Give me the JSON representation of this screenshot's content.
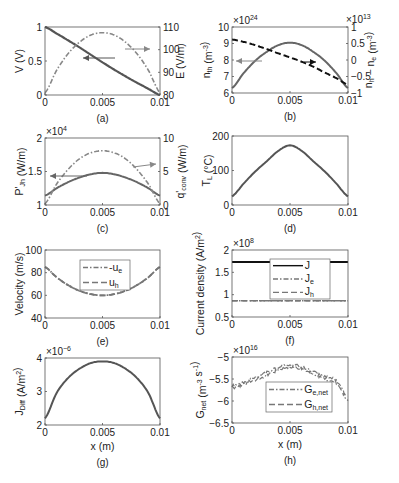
{
  "chart_data": [
    {
      "panel": "a",
      "caption": "(a)",
      "type": "line",
      "x": [
        0,
        0.001,
        0.002,
        0.003,
        0.004,
        0.005,
        0.006,
        0.007,
        0.008,
        0.009,
        0.01
      ],
      "xlim": [
        0,
        0.01
      ],
      "xticks": [
        "0",
        "0.005",
        "0.01"
      ],
      "xlabel": "",
      "ylabel": "V (V)",
      "ylim": [
        0,
        1
      ],
      "yticks": [
        "0",
        "0.5",
        "1"
      ],
      "y2label": "E (V/m)",
      "y2lim": [
        80,
        110
      ],
      "y2ticks": [
        "80",
        "90",
        "100",
        "110"
      ],
      "series": [
        {
          "name": "V",
          "axis": "left",
          "style": "solid",
          "color": "#555555",
          "values": [
            1.0,
            0.905,
            0.805,
            0.7,
            0.59,
            0.48,
            0.375,
            0.275,
            0.18,
            0.09,
            0.0
          ]
        },
        {
          "name": "E",
          "axis": "right",
          "style": "dash-dot",
          "color": "#888888",
          "values": [
            81,
            90.8,
            98.2,
            103.3,
            106.5,
            107.5,
            106.5,
            103.3,
            98.2,
            90.8,
            81
          ]
        }
      ],
      "annotations": [
        "arrow left (V)",
        "arrow right (E)"
      ]
    },
    {
      "panel": "b",
      "caption": "(b)",
      "type": "line",
      "x": [
        0,
        0.001,
        0.002,
        0.003,
        0.004,
        0.005,
        0.006,
        0.007,
        0.008,
        0.009,
        0.01
      ],
      "xlim": [
        0,
        0.01
      ],
      "xticks": [
        "0",
        "0.005",
        "0.01"
      ],
      "ylabel": "n_th (m^-3)",
      "yexp": "×10^24",
      "ylim": [
        6,
        10
      ],
      "yticks": [
        "6",
        "7",
        "8",
        "9",
        "10"
      ],
      "y2label": "n_h − n_e (m^-3)",
      "y2exp": "×10^13",
      "y2lim": [
        -1,
        1
      ],
      "y2ticks": [
        "-1",
        "-0.5",
        "0",
        "0.5",
        "1"
      ],
      "series": [
        {
          "name": "n_th",
          "axis": "left",
          "style": "solid",
          "color": "#666666",
          "values": [
            6.3,
            7.2,
            7.95,
            8.5,
            8.9,
            9.05,
            8.9,
            8.5,
            7.95,
            7.2,
            6.3
          ]
        },
        {
          "name": "n_h - n_e",
          "axis": "right",
          "style": "dashed",
          "color": "#111111",
          "values": [
            0.62,
            0.55,
            0.45,
            0.33,
            0.2,
            0.08,
            -0.05,
            -0.2,
            -0.38,
            -0.55,
            -0.75
          ]
        }
      ],
      "annotations": [
        "arrow left (n_th)",
        "arrow right (n_h - n_e)"
      ]
    },
    {
      "panel": "c",
      "caption": "(c)",
      "type": "line",
      "x": [
        0,
        0.001,
        0.002,
        0.003,
        0.004,
        0.005,
        0.006,
        0.007,
        0.008,
        0.009,
        0.01
      ],
      "xlim": [
        0,
        0.01
      ],
      "xticks": [
        "0",
        "0.005",
        "0.01"
      ],
      "ylabel": "P'_Jh (W/m)",
      "yexp": "×10^4",
      "ylim": [
        1,
        2
      ],
      "yticks": [
        "1",
        "1.5",
        "2"
      ],
      "y2label": "q'_conv (W/m)",
      "y2lim": [
        0,
        10
      ],
      "y2ticks": [
        "0",
        "5",
        "10"
      ],
      "series": [
        {
          "name": "P'_Jh",
          "axis": "left",
          "style": "solid",
          "color": "#666666",
          "values": [
            1.14,
            1.25,
            1.34,
            1.41,
            1.46,
            1.48,
            1.46,
            1.41,
            1.34,
            1.25,
            1.14
          ]
        },
        {
          "name": "q'_conv",
          "axis": "right",
          "style": "dash-dot",
          "color": "#888888",
          "values": [
            0.2,
            3.1,
            5.3,
            6.9,
            7.8,
            8.1,
            7.8,
            6.9,
            5.3,
            3.1,
            0.2
          ]
        }
      ],
      "annotations": [
        "arrow left (P'_Jh)",
        "arrow right (q'_conv)"
      ]
    },
    {
      "panel": "d",
      "caption": "(d)",
      "type": "line",
      "x": [
        0,
        0.001,
        0.002,
        0.003,
        0.004,
        0.005,
        0.006,
        0.007,
        0.008,
        0.009,
        0.01
      ],
      "xlim": [
        0,
        0.01
      ],
      "xticks": [
        "0",
        "0.005",
        "0.01"
      ],
      "ylabel": "T_L (°C)",
      "ylim": [
        0,
        200
      ],
      "yticks": [
        "0",
        "100",
        "200"
      ],
      "series": [
        {
          "name": "T_L",
          "style": "solid",
          "color": "#555555",
          "values": [
            25,
            62,
            97,
            127,
            157,
            173,
            157,
            127,
            97,
            62,
            25
          ]
        }
      ]
    },
    {
      "panel": "e",
      "caption": "(e)",
      "type": "line",
      "x": [
        0,
        0.001,
        0.002,
        0.003,
        0.004,
        0.005,
        0.006,
        0.007,
        0.008,
        0.009,
        0.01
      ],
      "xlim": [
        0,
        0.01
      ],
      "xticks": [
        "0",
        "0.005",
        "0.01"
      ],
      "ylabel": "Velocity (m/s)",
      "ylim": [
        40,
        100
      ],
      "yticks": [
        "40",
        "60",
        "80",
        "100"
      ],
      "legend": [
        "-u_e",
        "u_h"
      ],
      "series": [
        {
          "name": "-u_e",
          "style": "dash-dot",
          "color": "#777777",
          "values": [
            85,
            76,
            69,
            64,
            61,
            60,
            61,
            64,
            69,
            76,
            85
          ]
        },
        {
          "name": "u_h",
          "style": "dashed",
          "color": "#777777",
          "values": [
            85,
            76,
            69,
            64,
            61,
            60,
            61,
            64,
            69,
            76,
            85
          ]
        }
      ]
    },
    {
      "panel": "f",
      "caption": "(f)",
      "type": "line",
      "x": [
        0,
        0.01
      ],
      "xlim": [
        0,
        0.01
      ],
      "xticks": [
        "0",
        "0.005",
        "0.01"
      ],
      "ylabel": "Current density (A/m^2)",
      "yexp": "×10^8",
      "ylim": [
        0.5,
        2
      ],
      "yticks": [
        "0.5",
        "1",
        "1.5",
        "2"
      ],
      "legend": [
        "J",
        "J_e",
        "J_h"
      ],
      "series": [
        {
          "name": "J",
          "style": "solid",
          "color": "#111111",
          "values": [
            1.73,
            1.73
          ]
        },
        {
          "name": "J_e",
          "style": "dash-dot",
          "color": "#777777",
          "values": [
            0.865,
            0.865
          ]
        },
        {
          "name": "J_h",
          "style": "dashed",
          "color": "#777777",
          "values": [
            0.865,
            0.865
          ]
        }
      ]
    },
    {
      "panel": "g",
      "caption": "(g)",
      "type": "line",
      "x": [
        0,
        0.001,
        0.002,
        0.003,
        0.004,
        0.005,
        0.006,
        0.007,
        0.008,
        0.009,
        0.01
      ],
      "xlim": [
        0,
        0.01
      ],
      "xticks": [
        "0",
        "0.005",
        "0.01"
      ],
      "xlabel": "x (m)",
      "ylabel": "J_Diff (A/m^2)",
      "yexp": "×10^-6",
      "ylim": [
        2,
        4
      ],
      "yticks": [
        "2",
        "3",
        "4"
      ],
      "series": [
        {
          "name": "J_Diff",
          "style": "solid",
          "color": "#555555",
          "values": [
            2.2,
            2.95,
            3.4,
            3.68,
            3.85,
            3.9,
            3.85,
            3.68,
            3.4,
            2.95,
            2.2
          ]
        }
      ]
    },
    {
      "panel": "h",
      "caption": "(h)",
      "type": "line",
      "x": [
        0,
        0.001,
        0.002,
        0.003,
        0.004,
        0.005,
        0.006,
        0.007,
        0.008,
        0.009,
        0.01
      ],
      "xlim": [
        0,
        0.01
      ],
      "xticks": [
        "0",
        "0.005",
        "0.01"
      ],
      "xlabel": "x (m)",
      "ylabel": "G_net (m^-3 s^-1)",
      "yexp": "×10^16",
      "ylim": [
        -6.5,
        -5
      ],
      "yticks": [
        "-6.5",
        "-6",
        "-5.5",
        "-5"
      ],
      "legend": [
        "G_e,net",
        "G_h,net"
      ],
      "series": [
        {
          "name": "G_e,net",
          "style": "dash-dot",
          "color": "#777777",
          "noisy": true,
          "values": [
            -5.68,
            -5.6,
            -5.5,
            -5.38,
            -5.27,
            -5.2,
            -5.25,
            -5.35,
            -5.47,
            -5.57,
            -5.95
          ]
        },
        {
          "name": "G_h,net",
          "style": "dashed",
          "color": "#777777",
          "noisy": true,
          "values": [
            -5.68,
            -5.6,
            -5.5,
            -5.38,
            -5.27,
            -5.2,
            -5.25,
            -5.35,
            -5.47,
            -5.57,
            -5.95
          ]
        }
      ]
    }
  ]
}
